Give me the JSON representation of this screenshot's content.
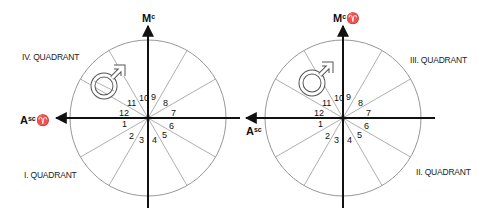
{
  "diagrams": [
    {
      "id": "left",
      "center": [
        148,
        118
      ],
      "radius": 78,
      "top_label": {
        "main": "M",
        "sup": "c"
      },
      "left_label": {
        "main": "A",
        "sup": "sc",
        "sign": "♈"
      },
      "quadrant_labels": [
        {
          "text": "IV. QUADRANT",
          "x": 22,
          "y": 60
        },
        {
          "text": "I. QUADRANT",
          "x": 24,
          "y": 178
        }
      ],
      "planet_symbol": "♂",
      "house_numbers": [
        "1",
        "2",
        "3",
        "4",
        "5",
        "6",
        "7",
        "8",
        "9",
        "10",
        "11",
        "12"
      ]
    },
    {
      "id": "right",
      "center": [
        343,
        118
      ],
      "radius": 78,
      "top_label": {
        "main": "M",
        "sup": "c",
        "sign": "♈"
      },
      "left_label": {
        "main": "A",
        "sup": "sc"
      },
      "quadrant_labels": [
        {
          "text": "III. QUADRANT",
          "x": 410,
          "y": 63
        },
        {
          "text": "II. QUADRANT",
          "x": 416,
          "y": 175
        }
      ],
      "planet_symbol": "♂",
      "house_numbers": [
        "1",
        "2",
        "3",
        "4",
        "5",
        "6",
        "7",
        "8",
        "9",
        "10",
        "11",
        "12"
      ]
    }
  ],
  "colors": {
    "axis": "#111111",
    "circle": "#8a8a8a",
    "divider": "#9a9a9a",
    "text": "#222222"
  }
}
